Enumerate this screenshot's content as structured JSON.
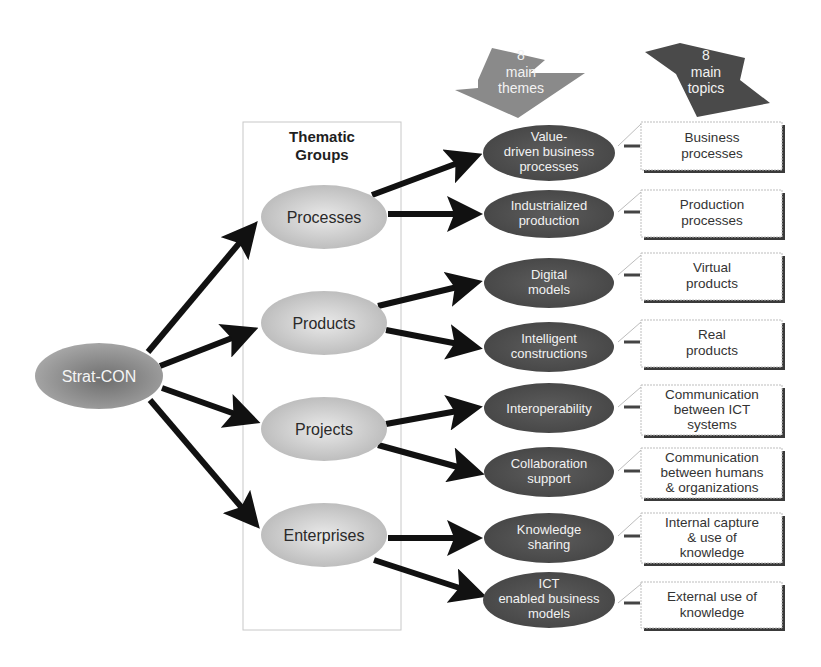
{
  "diagram": {
    "root": {
      "label": "Strat-CON"
    },
    "group_box": {
      "title_lines": [
        "Thematic",
        "Groups"
      ]
    },
    "column_headers": [
      {
        "id": "themes",
        "lines": [
          "8",
          "main",
          "themes"
        ],
        "color": "#8a8a8a"
      },
      {
        "id": "topics",
        "lines": [
          "8",
          "main",
          "topics"
        ],
        "color": "#4a4a4a"
      }
    ],
    "groups": [
      {
        "label": "Processes"
      },
      {
        "label": "Products"
      },
      {
        "label": "Projects"
      },
      {
        "label": "Enterprises"
      }
    ],
    "themes": [
      {
        "lines": [
          "Value-",
          "driven business",
          "processes"
        ],
        "group": "Processes"
      },
      {
        "lines": [
          "Industrialized",
          "production"
        ],
        "group": "Processes"
      },
      {
        "lines": [
          "Digital",
          "models"
        ],
        "group": "Products"
      },
      {
        "lines": [
          "Intelligent",
          "constructions"
        ],
        "group": "Products"
      },
      {
        "lines": [
          "Interoperability"
        ],
        "group": "Projects"
      },
      {
        "lines": [
          "Collaboration",
          "support"
        ],
        "group": "Projects"
      },
      {
        "lines": [
          "Knowledge",
          "sharing"
        ],
        "group": "Enterprises"
      },
      {
        "lines": [
          "ICT",
          "enabled business",
          "models"
        ],
        "group": "Enterprises"
      }
    ],
    "topics": [
      {
        "lines": [
          "Business",
          "processes"
        ]
      },
      {
        "lines": [
          "Production",
          "processes"
        ]
      },
      {
        "lines": [
          "Virtual",
          "products"
        ]
      },
      {
        "lines": [
          "Real",
          "products"
        ]
      },
      {
        "lines": [
          "Communication",
          "between ICT",
          "systems"
        ]
      },
      {
        "lines": [
          "Communication",
          "between humans",
          "& organizations"
        ]
      },
      {
        "lines": [
          "Internal capture",
          "& use of",
          "knowledge"
        ]
      },
      {
        "lines": [
          "External use of",
          "knowledge"
        ]
      }
    ],
    "colors": {
      "dark_node": "#4f4f4f",
      "light_node": "#c4c4c4",
      "root_node": "#8e8e8e",
      "arrow": "#111111",
      "box_border": "#bdbdbd",
      "box_shadow": "#3a3a3a"
    }
  }
}
